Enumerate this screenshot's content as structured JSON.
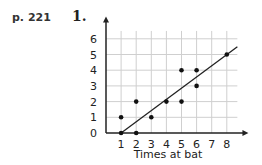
{
  "header": {
    "page_ref": "p. 221",
    "problem_number": "1."
  },
  "chart_data": {
    "type": "scatter",
    "title": "",
    "xlabel": "Times at bat",
    "ylabel": "",
    "x_ticks": [
      1,
      2,
      3,
      4,
      5,
      6,
      7,
      8
    ],
    "y_ticks": [
      0,
      1,
      2,
      3,
      4,
      5,
      6
    ],
    "xlim": [
      0,
      9
    ],
    "ylim": [
      0,
      6.5
    ],
    "grid": true,
    "points": [
      {
        "x": 1,
        "y": 1
      },
      {
        "x": 1,
        "y": 0
      },
      {
        "x": 2,
        "y": 2
      },
      {
        "x": 2,
        "y": 0
      },
      {
        "x": 3,
        "y": 1
      },
      {
        "x": 4,
        "y": 2
      },
      {
        "x": 5,
        "y": 4
      },
      {
        "x": 5,
        "y": 2
      },
      {
        "x": 6,
        "y": 4
      },
      {
        "x": 6,
        "y": 3
      },
      {
        "x": 8,
        "y": 5
      }
    ],
    "trend_line": {
      "x1": 1,
      "y1": 0,
      "x2": 8.7,
      "y2": 5.5
    }
  },
  "colors": {
    "grid": "#cfcfcf",
    "axis": "#222222",
    "point": "#111111"
  }
}
